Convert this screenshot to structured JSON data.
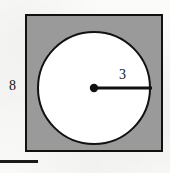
{
  "figure": {
    "kind": "geometry-diagram",
    "background_color": "#f7f7f5"
  },
  "square": {
    "name": "outer-square",
    "fill_color": "#9a9a9a",
    "stroke_color": "#111111",
    "stroke_width": 2,
    "x": 26,
    "y": 15,
    "size": 136,
    "side_label": "8"
  },
  "circle": {
    "name": "inscribed-circle",
    "fill_color": "#ffffff",
    "stroke_color": "#111111",
    "stroke_width": 2,
    "cx": 94,
    "cy": 88,
    "r": 58,
    "radius_label": "3"
  },
  "center_dot": {
    "name": "circle-center-dot",
    "cx": 94,
    "cy": 88,
    "r": 4,
    "color": "#111111"
  },
  "radius_line": {
    "name": "radius-segment",
    "x1": 94,
    "y1": 88,
    "x2": 152,
    "y2": 88,
    "color": "#111111",
    "stroke_width": 3
  },
  "baseline_rule": {
    "name": "bottom-rule",
    "x": 0,
    "y": 160,
    "width": 38,
    "height": 3,
    "color": "#1a1a1a"
  },
  "labels": {
    "side": "8",
    "radius": "3"
  }
}
